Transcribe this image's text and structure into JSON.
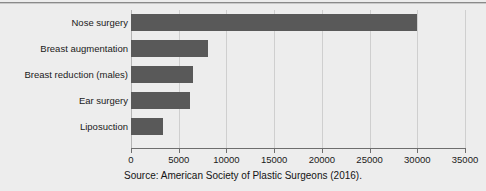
{
  "chart_data": {
    "type": "bar",
    "orientation": "horizontal",
    "title": "",
    "xlabel": "",
    "ylabel": "",
    "categories": [
      "Nose surgery",
      "Breast augmentation",
      "Breast reduction (males)",
      "Ear surgery",
      "Liposuction"
    ],
    "values": [
      30000,
      8100,
      6500,
      6200,
      3400
    ],
    "xlim": [
      0,
      35000
    ],
    "xticks": [
      0,
      5000,
      10000,
      15000,
      20000,
      25000,
      30000,
      35000
    ],
    "xticklabels": [
      "0",
      "5000",
      "10000",
      "15000",
      "20000",
      "25000",
      "30000",
      "35000"
    ],
    "grid": "vertical",
    "legend": "none",
    "bar_color": "#595959",
    "background_color": "#ededed",
    "gridline_color": "#cfcfcf",
    "axis_color": "#6e6e6e"
  },
  "caption": {
    "source": "Source: American Society of Plastic Surgeons (2016)."
  }
}
